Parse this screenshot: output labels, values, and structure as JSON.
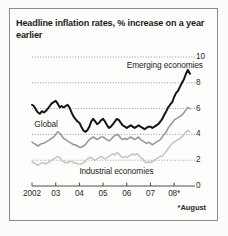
{
  "figure": {
    "title": "Headline inflation rates, % increase on a year earlier",
    "footnote": "*August",
    "border_color": "#8a8a88",
    "background": "#fdfdfc"
  },
  "chart_data": {
    "type": "line",
    "title": "Headline inflation rates, % increase on a year earlier",
    "xlabel": "",
    "ylabel": "",
    "ylim": [
      0,
      10
    ],
    "xlim": [
      2002.0,
      2008.67
    ],
    "yticks": [
      0,
      2,
      4,
      6,
      8,
      10
    ],
    "ytick_labels": [
      "0",
      "2",
      "4",
      "6",
      "8",
      "10"
    ],
    "y_axis_position": "right",
    "xticks": [
      2002,
      2003,
      2004,
      2005,
      2006,
      2007,
      2008
    ],
    "xtick_labels": [
      "2002",
      "03",
      "04",
      "05",
      "06",
      "07",
      "08*"
    ],
    "grid": "horizontal-dotted",
    "legend_position": "inline-annotations",
    "annotations": [
      {
        "text": "Emerging economies",
        "x": 2006.0,
        "y": 9.3
      },
      {
        "text": "Global",
        "x": 2002.1,
        "y": 4.75
      },
      {
        "text": "Industrial economies",
        "x": 2004.0,
        "y": 1.05
      }
    ],
    "series": [
      {
        "name": "Emerging economies",
        "color": "#151515",
        "width": 2.0,
        "x": [
          2002.0,
          2002.08,
          2002.17,
          2002.25,
          2002.33,
          2002.42,
          2002.5,
          2002.58,
          2002.67,
          2002.75,
          2002.83,
          2002.92,
          2003.0,
          2003.08,
          2003.17,
          2003.25,
          2003.33,
          2003.42,
          2003.5,
          2003.58,
          2003.67,
          2003.75,
          2003.83,
          2003.92,
          2004.0,
          2004.08,
          2004.17,
          2004.25,
          2004.33,
          2004.42,
          2004.5,
          2004.58,
          2004.67,
          2004.75,
          2004.83,
          2004.92,
          2005.0,
          2005.08,
          2005.17,
          2005.25,
          2005.33,
          2005.42,
          2005.5,
          2005.58,
          2005.67,
          2005.75,
          2005.83,
          2005.92,
          2006.0,
          2006.08,
          2006.17,
          2006.25,
          2006.33,
          2006.42,
          2006.5,
          2006.58,
          2006.67,
          2006.75,
          2006.83,
          2006.92,
          2007.0,
          2007.08,
          2007.17,
          2007.25,
          2007.33,
          2007.42,
          2007.5,
          2007.58,
          2007.67,
          2007.75,
          2007.83,
          2007.92,
          2008.0,
          2008.08,
          2008.17,
          2008.25,
          2008.33,
          2008.42,
          2008.5,
          2008.58,
          2008.67
        ],
        "values": [
          6.3,
          6.2,
          5.9,
          5.7,
          5.6,
          5.8,
          5.7,
          5.8,
          6.0,
          6.2,
          6.4,
          6.5,
          6.6,
          6.4,
          6.1,
          6.2,
          6.1,
          6.2,
          6.3,
          6.1,
          5.7,
          5.4,
          5.2,
          5.0,
          4.9,
          4.6,
          4.3,
          4.2,
          4.3,
          4.6,
          5.0,
          5.2,
          5.0,
          4.8,
          4.9,
          5.1,
          5.2,
          5.0,
          4.7,
          4.5,
          4.6,
          4.8,
          5.0,
          5.2,
          5.1,
          4.9,
          4.7,
          4.6,
          4.5,
          4.6,
          4.7,
          4.6,
          4.5,
          4.6,
          4.7,
          4.6,
          4.5,
          4.4,
          4.5,
          4.6,
          4.6,
          4.5,
          4.6,
          4.7,
          4.8,
          5.0,
          5.2,
          5.5,
          5.8,
          6.1,
          6.3,
          6.5,
          6.9,
          7.2,
          7.4,
          7.7,
          8.0,
          8.3,
          8.7,
          9.0,
          8.7
        ]
      },
      {
        "name": "Global",
        "color": "#9a9a98",
        "width": 1.6,
        "x": [
          2002.0,
          2002.08,
          2002.17,
          2002.25,
          2002.33,
          2002.42,
          2002.5,
          2002.58,
          2002.67,
          2002.75,
          2002.83,
          2002.92,
          2003.0,
          2003.08,
          2003.17,
          2003.25,
          2003.33,
          2003.42,
          2003.5,
          2003.58,
          2003.67,
          2003.75,
          2003.83,
          2003.92,
          2004.0,
          2004.08,
          2004.17,
          2004.25,
          2004.33,
          2004.42,
          2004.5,
          2004.58,
          2004.67,
          2004.75,
          2004.83,
          2004.92,
          2005.0,
          2005.08,
          2005.17,
          2005.25,
          2005.33,
          2005.42,
          2005.5,
          2005.58,
          2005.67,
          2005.75,
          2005.83,
          2005.92,
          2006.0,
          2006.08,
          2006.17,
          2006.25,
          2006.33,
          2006.42,
          2006.5,
          2006.58,
          2006.67,
          2006.75,
          2006.83,
          2006.92,
          2007.0,
          2007.08,
          2007.17,
          2007.25,
          2007.33,
          2007.42,
          2007.5,
          2007.58,
          2007.67,
          2007.75,
          2007.83,
          2007.92,
          2008.0,
          2008.08,
          2008.17,
          2008.25,
          2008.33,
          2008.42,
          2008.5,
          2008.58,
          2008.67
        ],
        "values": [
          3.4,
          3.3,
          3.2,
          3.1,
          3.2,
          3.3,
          3.3,
          3.4,
          3.5,
          3.6,
          3.7,
          3.8,
          4.0,
          4.2,
          4.1,
          3.9,
          3.7,
          3.6,
          3.5,
          3.4,
          3.3,
          3.2,
          3.2,
          3.1,
          3.0,
          3.0,
          3.1,
          3.2,
          3.4,
          3.6,
          3.7,
          3.8,
          3.7,
          3.6,
          3.7,
          3.8,
          3.8,
          3.7,
          3.6,
          3.5,
          3.6,
          3.8,
          3.9,
          4.0,
          3.9,
          3.7,
          3.6,
          3.7,
          3.6,
          3.7,
          3.8,
          3.7,
          3.6,
          3.7,
          3.8,
          3.6,
          3.5,
          3.4,
          3.3,
          3.4,
          3.3,
          3.2,
          3.3,
          3.4,
          3.5,
          3.6,
          3.8,
          4.0,
          4.2,
          4.5,
          4.7,
          4.9,
          5.1,
          5.2,
          5.3,
          5.4,
          5.5,
          5.7,
          5.9,
          6.1,
          6.0
        ]
      },
      {
        "name": "Industrial economies",
        "color": "#c6c6c3",
        "width": 1.6,
        "x": [
          2002.0,
          2002.08,
          2002.17,
          2002.25,
          2002.33,
          2002.42,
          2002.5,
          2002.58,
          2002.67,
          2002.75,
          2002.83,
          2002.92,
          2003.0,
          2003.08,
          2003.17,
          2003.25,
          2003.33,
          2003.42,
          2003.5,
          2003.58,
          2003.67,
          2003.75,
          2003.83,
          2003.92,
          2004.0,
          2004.08,
          2004.17,
          2004.25,
          2004.33,
          2004.42,
          2004.5,
          2004.58,
          2004.67,
          2004.75,
          2004.83,
          2004.92,
          2005.0,
          2005.08,
          2005.17,
          2005.25,
          2005.33,
          2005.42,
          2005.5,
          2005.58,
          2005.67,
          2005.75,
          2005.83,
          2005.92,
          2006.0,
          2006.08,
          2006.17,
          2006.25,
          2006.33,
          2006.42,
          2006.5,
          2006.58,
          2006.67,
          2006.75,
          2006.83,
          2006.92,
          2007.0,
          2007.08,
          2007.17,
          2007.25,
          2007.33,
          2007.42,
          2007.5,
          2007.58,
          2007.67,
          2007.75,
          2007.83,
          2007.92,
          2008.0,
          2008.08,
          2008.17,
          2008.25,
          2008.33,
          2008.42,
          2008.5,
          2008.58,
          2008.67
        ],
        "values": [
          1.9,
          1.8,
          1.7,
          1.6,
          1.7,
          1.8,
          1.8,
          1.7,
          1.8,
          1.9,
          2.0,
          2.1,
          2.2,
          2.3,
          2.2,
          2.0,
          1.9,
          1.8,
          1.8,
          1.9,
          1.9,
          1.8,
          1.8,
          1.7,
          1.7,
          1.7,
          1.8,
          1.9,
          2.1,
          2.2,
          2.2,
          2.1,
          2.0,
          2.1,
          2.2,
          2.3,
          2.2,
          2.1,
          2.2,
          2.3,
          2.4,
          2.5,
          2.4,
          2.6,
          2.5,
          2.3,
          2.2,
          2.3,
          2.2,
          2.3,
          2.4,
          2.5,
          2.4,
          2.5,
          2.4,
          2.2,
          2.1,
          1.9,
          1.8,
          1.9,
          1.8,
          1.9,
          2.0,
          2.1,
          2.2,
          2.3,
          2.3,
          2.5,
          2.7,
          2.9,
          3.1,
          3.3,
          3.4,
          3.5,
          3.6,
          3.7,
          3.8,
          4.0,
          4.2,
          4.3,
          4.2
        ]
      }
    ]
  }
}
